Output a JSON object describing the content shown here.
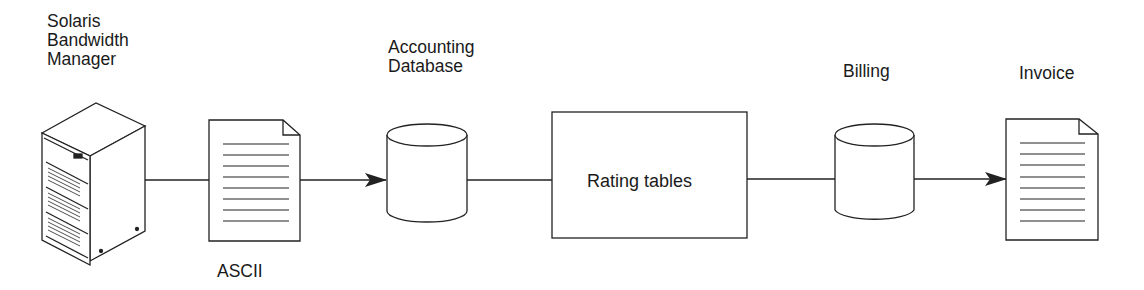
{
  "diagram": {
    "nodes": {
      "server": {
        "label": "Solaris\nBandwidth\nManager",
        "kind": "server-tower"
      },
      "ascii": {
        "label": "ASCII",
        "kind": "document"
      },
      "accounting_db": {
        "label": "Accounting\nDatabase",
        "kind": "database"
      },
      "rating": {
        "label": "Rating tables",
        "kind": "process-box"
      },
      "billing": {
        "label": "Billing",
        "kind": "database"
      },
      "invoice": {
        "label": "Invoice",
        "kind": "document"
      }
    },
    "edges": [
      {
        "from": "server",
        "to": "ascii",
        "arrow": false
      },
      {
        "from": "ascii",
        "to": "accounting_db",
        "arrow": true
      },
      {
        "from": "accounting_db",
        "to": "rating",
        "arrow": false
      },
      {
        "from": "rating",
        "to": "billing",
        "arrow": false
      },
      {
        "from": "billing",
        "to": "invoice",
        "arrow": true
      }
    ],
    "colors": {
      "stroke": "#222222",
      "background": "#ffffff"
    }
  }
}
